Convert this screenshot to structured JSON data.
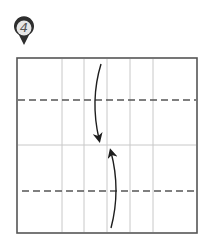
{
  "step": {
    "number": "4",
    "badge_colors": {
      "outer": "#2e2e2e",
      "inner": "#e6e6e6",
      "text": "#555555"
    }
  },
  "diagram": {
    "paper_colors": {
      "border": "#555555",
      "crease": "#c8c8c8",
      "valley_fold": "#555555",
      "arrow": "#1e1e1e"
    },
    "square": {
      "x": 17,
      "y": 58,
      "w": 180,
      "h": 175
    },
    "vertical_creases_x": [
      62,
      84,
      107,
      130,
      153
    ],
    "horizontal_crease_y": 145,
    "valley_fold_lines_y": [
      100,
      191
    ],
    "arrows": [
      {
        "name": "fold-down-arrow",
        "direction": "down"
      },
      {
        "name": "fold-up-arrow",
        "direction": "up"
      }
    ]
  }
}
